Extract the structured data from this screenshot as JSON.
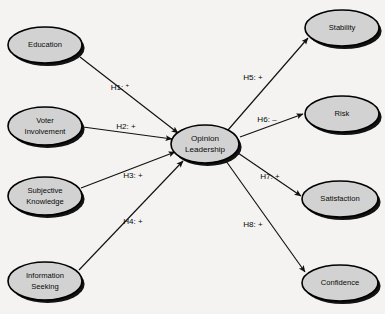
{
  "diagram": {
    "background_color": "#f4f3f1",
    "node_fill_color": "#d2d2d2",
    "node_stroke_color": "#000000",
    "line_color": "#111111"
  },
  "nodes": {
    "center": {
      "id": "opinion-leadership",
      "label_line1": "Opinion",
      "label_line2": "Leadership",
      "cx": 205,
      "cy": 144,
      "rx": 34,
      "ry": 19
    },
    "antecedents": [
      {
        "id": "education",
        "label_line1": "Education",
        "label_line2": "",
        "cx": 45,
        "cy": 45,
        "rx": 37,
        "ry": 18
      },
      {
        "id": "voter-involvement",
        "label_line1": "Voter",
        "label_line2": "Involvement",
        "cx": 45,
        "cy": 126,
        "rx": 37,
        "ry": 19
      },
      {
        "id": "subjective-knowledge",
        "label_line1": "Subjective",
        "label_line2": "Knowledge",
        "cx": 45,
        "cy": 196,
        "rx": 37,
        "ry": 19
      },
      {
        "id": "information-seeking",
        "label_line1": "Information",
        "label_line2": "Seeking",
        "cx": 45,
        "cy": 281,
        "rx": 37,
        "ry": 19
      }
    ],
    "outcomes": [
      {
        "id": "stability",
        "label_line1": "Stability",
        "label_line2": "",
        "cx": 342,
        "cy": 28,
        "rx": 37,
        "ry": 18
      },
      {
        "id": "risk",
        "label_line1": "Risk",
        "label_line2": "",
        "cx": 342,
        "cy": 114,
        "rx": 37,
        "ry": 18
      },
      {
        "id": "satisfaction",
        "label_line1": "Satisfaction",
        "label_line2": "",
        "cx": 340,
        "cy": 199,
        "rx": 38,
        "ry": 18
      },
      {
        "id": "confidence",
        "label_line1": "Confidence",
        "label_line2": "",
        "cx": 340,
        "cy": 283,
        "rx": 38,
        "ry": 18
      }
    ]
  },
  "paths": [
    {
      "id": "h1",
      "label": "H1:",
      "sign": "+",
      "sign_superscript": true,
      "from": "education",
      "to": "opinion-leadership",
      "label_x": 120,
      "label_y": 88,
      "x1": 80,
      "y1": 57,
      "x2": 178,
      "y2": 133
    },
    {
      "id": "h2",
      "label": "H2:",
      "sign": "+",
      "sign_superscript": false,
      "from": "voter-involvement",
      "to": "opinion-leadership",
      "label_x": 126,
      "label_y": 127,
      "x1": 83,
      "y1": 127,
      "x2": 172,
      "y2": 139
    },
    {
      "id": "h3",
      "label": "H3:",
      "sign": "+",
      "sign_superscript": false,
      "from": "subjective-knowledge",
      "to": "opinion-leadership",
      "label_x": 133,
      "label_y": 176,
      "x1": 81,
      "y1": 188,
      "x2": 175,
      "y2": 152
    },
    {
      "id": "h4",
      "label": "H4:",
      "sign": "+",
      "sign_superscript": false,
      "from": "information-seeking",
      "to": "opinion-leadership",
      "label_x": 133,
      "label_y": 222,
      "x1": 79,
      "y1": 270,
      "x2": 183,
      "y2": 161
    },
    {
      "id": "h5",
      "label": "H5:",
      "sign": "+",
      "sign_superscript": false,
      "from": "opinion-leadership",
      "to": "stability",
      "label_x": 253,
      "label_y": 78,
      "x1": 228,
      "y1": 130,
      "x2": 308,
      "y2": 38
    },
    {
      "id": "h6",
      "label": "H6:",
      "sign": "–",
      "sign_superscript": false,
      "from": "opinion-leadership",
      "to": "risk",
      "label_x": 267,
      "label_y": 120,
      "x1": 240,
      "y1": 137,
      "x2": 303,
      "y2": 114
    },
    {
      "id": "h7",
      "label": "H7:",
      "sign": "+",
      "sign_superscript": false,
      "from": "opinion-leadership",
      "to": "satisfaction",
      "label_x": 270,
      "label_y": 177,
      "x1": 238,
      "y1": 153,
      "x2": 301,
      "y2": 196
    },
    {
      "id": "h8",
      "label": "H8:",
      "sign": "+",
      "sign_superscript": false,
      "from": "opinion-leadership",
      "to": "confidence",
      "label_x": 253,
      "label_y": 225,
      "x1": 226,
      "y1": 161,
      "x2": 305,
      "y2": 272
    }
  ]
}
